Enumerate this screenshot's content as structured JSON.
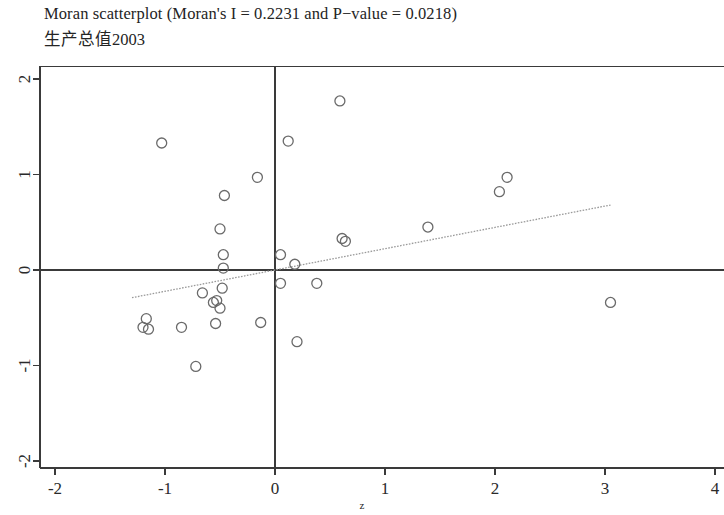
{
  "window": {
    "app": "R graphics device"
  },
  "titles": {
    "main": "Moran scatterplot (Moran's I = 0.2231 and P−value = 0.0218)",
    "sub": "生产总值2003"
  },
  "chart_data": {
    "type": "scatter",
    "title": "Moran scatterplot (Moran's I = 0.2231 and P−value = 0.0218)",
    "subtitle": "生产总值2003",
    "xlabel": "z",
    "ylabel": "",
    "xlim": [
      -2.15,
      4.1
    ],
    "ylim": [
      -2.15,
      2.15
    ],
    "xticks": [
      -2,
      -1,
      0,
      1,
      2,
      3,
      4
    ],
    "yticks": [
      -2,
      -1,
      0,
      1,
      2
    ],
    "xtick_labels": [
      "-2",
      "-1",
      "0",
      "1",
      "2",
      "3",
      "4"
    ],
    "ytick_labels": [
      "-2",
      "-1",
      "0",
      "1",
      "2"
    ],
    "grid": false,
    "legend": null,
    "statistics": {
      "morans_i": 0.2231,
      "p_value": 0.0218
    },
    "reference_lines": [
      {
        "name": "horizontal-mean-line",
        "orientation": "horizontal",
        "value": 0,
        "color": "#3a3a3a"
      },
      {
        "name": "vertical-mean-line",
        "orientation": "vertical",
        "value": 0,
        "color": "#3a3a3a"
      }
    ],
    "fit_line": {
      "name": "lm-fit-line",
      "style": "dotted",
      "color": "#9a9a9a",
      "slope": 0.2231,
      "intercept": 0.0,
      "x_start": -1.3,
      "x_end": 3.05
    },
    "marker": {
      "shape": "open-circle",
      "radius_px": 5,
      "stroke": "#6a6a6a",
      "fill": "none"
    },
    "points": [
      {
        "x": -1.03,
        "y": 1.33
      },
      {
        "x": 0.12,
        "y": 1.35
      },
      {
        "x": 0.59,
        "y": 1.77
      },
      {
        "x": -0.16,
        "y": 0.97
      },
      {
        "x": -0.46,
        "y": 0.78
      },
      {
        "x": -0.5,
        "y": 0.43
      },
      {
        "x": -0.47,
        "y": 0.16
      },
      {
        "x": -0.47,
        "y": 0.02
      },
      {
        "x": -0.48,
        "y": -0.19
      },
      {
        "x": -0.53,
        "y": -0.32
      },
      {
        "x": -0.5,
        "y": -0.4
      },
      {
        "x": -0.56,
        "y": -0.34
      },
      {
        "x": -0.66,
        "y": -0.24
      },
      {
        "x": -1.17,
        "y": -0.51
      },
      {
        "x": -1.2,
        "y": -0.6
      },
      {
        "x": -1.15,
        "y": -0.62
      },
      {
        "x": -0.85,
        "y": -0.6
      },
      {
        "x": -0.54,
        "y": -0.56
      },
      {
        "x": -0.72,
        "y": -1.01
      },
      {
        "x": -0.13,
        "y": -0.55
      },
      {
        "x": 0.05,
        "y": 0.16
      },
      {
        "x": 0.18,
        "y": 0.06
      },
      {
        "x": 0.05,
        "y": -0.14
      },
      {
        "x": 0.38,
        "y": -0.14
      },
      {
        "x": 0.2,
        "y": -0.75
      },
      {
        "x": 0.61,
        "y": 0.33
      },
      {
        "x": 0.64,
        "y": 0.3
      },
      {
        "x": 1.39,
        "y": 0.45
      },
      {
        "x": 2.04,
        "y": 0.82
      },
      {
        "x": 2.11,
        "y": 0.97
      },
      {
        "x": 3.05,
        "y": -0.34
      }
    ]
  },
  "colors": {
    "axis": "#3a3a3a",
    "marker_stroke": "#6a6a6a",
    "fit_line": "#9a9a9a",
    "text": "#242424",
    "background": "#ffffff"
  }
}
